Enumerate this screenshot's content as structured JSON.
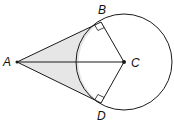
{
  "diagram": {
    "points": {
      "A": {
        "label": "A",
        "x": 17,
        "y": 62
      },
      "B": {
        "label": "B",
        "x": 101,
        "y": 22
      },
      "C": {
        "label": "C",
        "x": 124,
        "y": 62
      },
      "D": {
        "label": "D",
        "x": 101,
        "y": 103
      }
    },
    "circle": {
      "center": "C",
      "radius": 48
    },
    "segments": [
      "AB",
      "AD",
      "AC",
      "BC",
      "DC"
    ],
    "right_angles": [
      "ABC",
      "ADC"
    ],
    "shaded_region": "Region between tangents AB, AD and the circle arc",
    "colors": {
      "stroke": "#1a1a1a",
      "shade": "#e6e6e6"
    }
  }
}
